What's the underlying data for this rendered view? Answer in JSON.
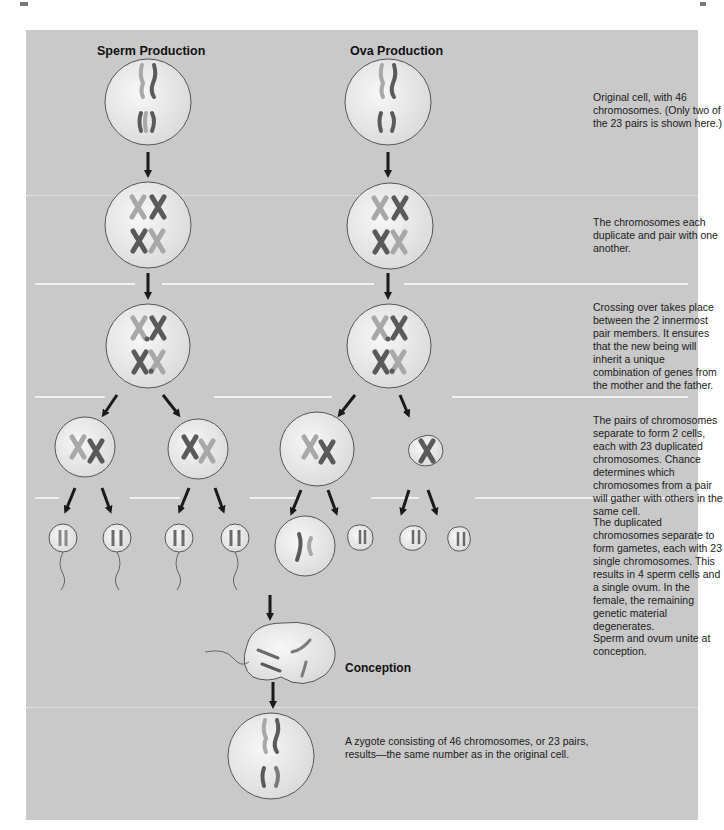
{
  "columns": {
    "sperm": "Sperm Production",
    "ova": "Ova Production"
  },
  "steps": [
    {
      "id": "original",
      "text": "Original cell, with 46 chromosomes. (Only two of the 23 pairs is shown here.)"
    },
    {
      "id": "duplicate",
      "text": "The chromosomes each duplicate and pair with one another."
    },
    {
      "id": "crossing-over",
      "text": "Crossing over takes place between the 2 innermost pair members. It ensures that the new being will inherit a unique combination of genes from the mother and the father."
    },
    {
      "id": "separate",
      "text": "The pairs of chromosomes separate to form 2 cells, each with 23 duplicated chromosomes. Chance determines which chromosomes from a pair will gather with others in the same cell."
    },
    {
      "id": "gametes",
      "text": "The duplicated chromosomes separate to form gametes, each with 23 single chromosomes. This results in 4 sperm cells and a single ovum. In the female, the remaining genetic material degenerates."
    },
    {
      "id": "conception",
      "text": "Sperm and ovum unite at conception."
    }
  ],
  "conception_label": "Conception",
  "zygote_text": "A zygote consisting of 46 chromosomes, or 23 pairs, results—the same number as in the original cell.",
  "colors": {
    "panel": "#c9c9c9",
    "cell_fill": "#ececec",
    "cell_stroke": "#555555",
    "chrom_light": "#a8a8a8",
    "chrom_dark": "#5a5a5a",
    "arrow": "#1a1a1a",
    "divider": "#f1f1f1"
  }
}
